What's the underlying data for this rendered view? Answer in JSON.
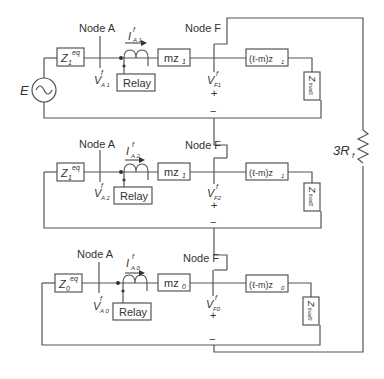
{
  "diagram": {
    "title": "",
    "source_label": "E",
    "fault_resistor_label": "3R",
    "fault_resistor_sub": "f",
    "sequence_networks": [
      {
        "name": "positive",
        "node_a_label": "Node A",
        "node_f_label": "Node F",
        "source_impedance": "Z",
        "source_impedance_sub": "1",
        "source_impedance_sup": "eq",
        "current_label": "I",
        "current_sub": "A 1",
        "current_sup": "f",
        "voltage_a_label": "V",
        "voltage_a_sub": "A 1",
        "voltage_a_sup": "f",
        "relay_label": "Relay",
        "line_to_fault": "mz",
        "line_to_fault_sub": "1",
        "line_beyond_fault": "(ℓ-m)z",
        "line_beyond_fault_sub": "1",
        "voltage_f_label": "V",
        "voltage_f_sub": "F1",
        "voltage_f_sup": "f",
        "plus": "+",
        "minus": "−",
        "load_impedance": "Z",
        "load_impedance_sub": "load1"
      },
      {
        "name": "negative",
        "node_a_label": "Node A",
        "node_f_label": "Node F",
        "source_impedance": "Z",
        "source_impedance_sub": "1",
        "source_impedance_sup": "eq",
        "current_label": "I",
        "current_sub": "A 2",
        "current_sup": "f",
        "voltage_a_label": "V",
        "voltage_a_sub": "A 2",
        "voltage_a_sup": "f",
        "relay_label": "Relay",
        "line_to_fault": "mz",
        "line_to_fault_sub": "1",
        "line_beyond_fault": "(ℓ-m)z",
        "line_beyond_fault_sub": "1",
        "voltage_f_label": "V",
        "voltage_f_sub": "F2",
        "voltage_f_sup": "f",
        "plus": "+",
        "minus": "−",
        "load_impedance": "Z",
        "load_impedance_sub": "load2"
      },
      {
        "name": "zero",
        "node_a_label": "Node A",
        "node_f_label": "Node F",
        "source_impedance": "Z",
        "source_impedance_sub": "0",
        "source_impedance_sup": "eq",
        "current_label": "I",
        "current_sub": "A 0",
        "current_sup": "f",
        "voltage_a_label": "V",
        "voltage_a_sub": "A 0",
        "voltage_a_sup": "f",
        "relay_label": "Relay",
        "line_to_fault": "mz",
        "line_to_fault_sub": "0",
        "line_beyond_fault": "(ℓ-m)z",
        "line_beyond_fault_sub": "0",
        "voltage_f_label": "V",
        "voltage_f_sub": "F0",
        "voltage_f_sup": "f",
        "plus": "+",
        "minus": "−",
        "load_impedance": "Z",
        "load_impedance_sub": "load0"
      }
    ],
    "colors": {
      "wire": "#555555",
      "text": "#333333",
      "background": "#ffffff"
    }
  }
}
